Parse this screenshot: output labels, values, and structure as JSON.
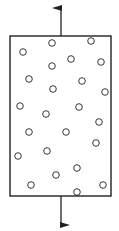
{
  "diagram": {
    "colors": {
      "stroke": "#222222",
      "background": "#ffffff"
    },
    "box": {
      "x": 10,
      "y": 36,
      "width": 101,
      "height": 160
    },
    "arrows": [
      {
        "name": "tension-arrow-up",
        "x": 61,
        "y1": 36,
        "y2": 8
      },
      {
        "name": "tension-arrow-down",
        "x": 61,
        "y1": 196,
        "y2": 225
      }
    ],
    "particles": [
      [
        23,
        52
      ],
      [
        52,
        43
      ],
      [
        91,
        41
      ],
      [
        52,
        66
      ],
      [
        71,
        59
      ],
      [
        101,
        62
      ],
      [
        29,
        79
      ],
      [
        82,
        81
      ],
      [
        53,
        89
      ],
      [
        105,
        92
      ],
      [
        20,
        106
      ],
      [
        79,
        107
      ],
      [
        46,
        114
      ],
      [
        99,
        122
      ],
      [
        29,
        132
      ],
      [
        66,
        132
      ],
      [
        96,
        143
      ],
      [
        18,
        156
      ],
      [
        47,
        151
      ],
      [
        77,
        168
      ],
      [
        56,
        175
      ],
      [
        31,
        185
      ],
      [
        103,
        185
      ],
      [
        77,
        192
      ]
    ],
    "particle_radius": 3.3
  }
}
